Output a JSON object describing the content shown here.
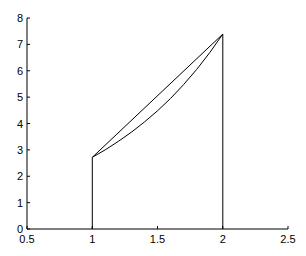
{
  "chart_data": {
    "type": "line",
    "title": "",
    "xlabel": "",
    "ylabel": "",
    "xlim": [
      0.5,
      2.5
    ],
    "ylim": [
      0,
      8
    ],
    "xticks": [
      0.5,
      1,
      1.5,
      2,
      2.5
    ],
    "xtick_labels": [
      "0.5",
      "1",
      "1.5",
      "2",
      "2.5"
    ],
    "yticks": [
      0,
      1,
      2,
      3,
      4,
      5,
      6,
      7,
      8
    ],
    "ytick_labels": [
      "0",
      "1",
      "2",
      "3",
      "4",
      "5",
      "6",
      "7",
      "8"
    ],
    "grid": false,
    "legend": null,
    "series": [
      {
        "name": "exp(x) curve",
        "function": "e^x",
        "x": [
          1,
          1.1,
          1.2,
          1.3,
          1.4,
          1.5,
          1.6,
          1.7,
          1.8,
          1.9,
          2
        ],
        "y": [
          2.718,
          3.004,
          3.32,
          3.669,
          4.055,
          4.482,
          4.953,
          5.474,
          6.05,
          6.686,
          7.389
        ]
      },
      {
        "name": "chord (trapezoid top)",
        "x": [
          1,
          2
        ],
        "y": [
          2.718,
          7.389
        ]
      },
      {
        "name": "left boundary",
        "x": [
          1,
          1
        ],
        "y": [
          0,
          2.718
        ]
      },
      {
        "name": "right boundary",
        "x": [
          2,
          2
        ],
        "y": [
          0,
          7.389
        ]
      }
    ]
  }
}
